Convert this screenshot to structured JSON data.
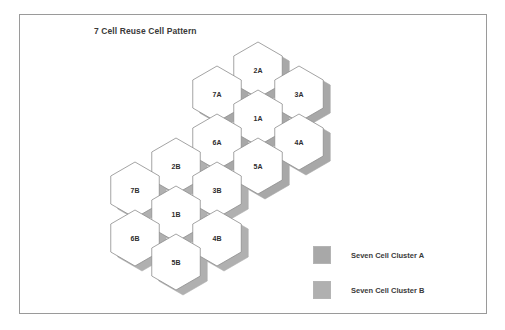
{
  "figure": {
    "title": "7 Cell Reuse Cell Pattern",
    "background_color": "#ffffff",
    "frame_color": "#9a9a9a"
  },
  "colors": {
    "cell_fill": "#ffffff",
    "cell_stroke": "#8d8d8d",
    "shadow_a": "#a8a8a8",
    "shadow_b": "#b0b0b0",
    "label_text": "#2e2e2e",
    "title_text": "#3a3a3a"
  },
  "clusters": [
    {
      "id": "cluster-a",
      "name": "Seven Cell Cluster A",
      "shadow_color": "#a8a8a8",
      "cells": [
        {
          "label": "2A",
          "cx": 258,
          "cy": 70
        },
        {
          "label": "7A",
          "cx": 217,
          "cy": 94
        },
        {
          "label": "3A",
          "cx": 299,
          "cy": 94
        },
        {
          "label": "1A",
          "cx": 258,
          "cy": 118
        },
        {
          "label": "6A",
          "cx": 217,
          "cy": 142
        },
        {
          "label": "4A",
          "cx": 299,
          "cy": 142
        },
        {
          "label": "5A",
          "cx": 258,
          "cy": 166
        }
      ]
    },
    {
      "id": "cluster-b",
      "name": "Seven Cell Cluster B",
      "shadow_color": "#b0b0b0",
      "cells": [
        {
          "label": "2B",
          "cx": 176,
          "cy": 166
        },
        {
          "label": "7B",
          "cx": 135,
          "cy": 190
        },
        {
          "label": "3B",
          "cx": 217,
          "cy": 190
        },
        {
          "label": "1B",
          "cx": 176,
          "cy": 214
        },
        {
          "label": "6B",
          "cx": 135,
          "cy": 238
        },
        {
          "label": "4B",
          "cx": 217,
          "cy": 238
        },
        {
          "label": "5B",
          "cx": 176,
          "cy": 262
        }
      ]
    }
  ],
  "hex_geometry": {
    "radius": 28,
    "column_step": 41,
    "row_step": 48,
    "row_half_offset": 24,
    "shadow_offset_x": 7,
    "shadow_offset_y": 5
  },
  "legend": {
    "items": [
      {
        "label": "Seven Cell Cluster A",
        "color": "#a8a8a8"
      },
      {
        "label": "Seven Cell Cluster B",
        "color": "#b0b0b0"
      }
    ]
  }
}
